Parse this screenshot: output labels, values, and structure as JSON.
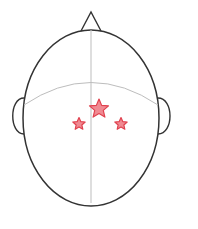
{
  "diagram": {
    "type": "head-top-view",
    "colors": {
      "outline": "#333333",
      "guide": "#bdbdbd",
      "star_fill": "#f08a92",
      "star_stroke": "#e0424f",
      "background": "#ffffff"
    },
    "head": {
      "cx": 91,
      "cy": 118,
      "rx": 68,
      "ry": 88
    },
    "nose": {
      "apex": [
        91,
        12
      ],
      "base_left": [
        81,
        31
      ],
      "base_right": [
        101,
        31
      ]
    },
    "ears": [
      {
        "side": "left",
        "x": 24,
        "top": 98,
        "bottom": 134,
        "bulge": 15
      },
      {
        "side": "right",
        "x": 158,
        "top": 98,
        "bottom": 134,
        "bulge": 16
      }
    ],
    "guides": {
      "midline": {
        "x": 91,
        "y1": 30,
        "y2": 203
      },
      "coronal_arc": {
        "start": [
          24,
          105
        ],
        "control": [
          91,
          60
        ],
        "end": [
          158,
          105
        ]
      }
    },
    "markers": [
      {
        "name": "center-star",
        "x": 99,
        "y": 109,
        "r_outer": 10,
        "r_inner": 4.5
      },
      {
        "name": "left-star",
        "x": 79,
        "y": 124,
        "r_outer": 6.5,
        "r_inner": 3
      },
      {
        "name": "right-star",
        "x": 121,
        "y": 124,
        "r_outer": 6.5,
        "r_inner": 3
      }
    ]
  }
}
